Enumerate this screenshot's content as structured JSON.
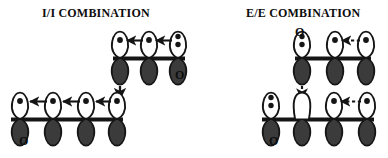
{
  "figure": {
    "background_color": "#ffffff",
    "ink_color": "#151515",
    "lobe_fill_dark": "#3b3b3b",
    "lobe_fill_light": "#ffffff",
    "panels": [
      {
        "id": "ii",
        "title": "I/I COMBINATION",
        "fragments": [
          {
            "id": "ii-top",
            "orbitals": [
              {
                "electrons": 1,
                "top_lobe": "light",
                "bottom_lobe": "dark"
              },
              {
                "electrons": 1,
                "top_lobe": "light",
                "bottom_lobe": "dark"
              },
              {
                "electrons": 2,
                "top_lobe": "light",
                "bottom_lobe": "dark"
              }
            ],
            "arrows": [
              "solid-left",
              "solid-left"
            ],
            "labels": [
              {
                "text": "O",
                "position": "below-right"
              }
            ]
          },
          {
            "id": "ii-bottom",
            "orbitals": [
              {
                "electrons": 1,
                "top_lobe": "light",
                "bottom_lobe": "dark"
              },
              {
                "electrons": 1,
                "top_lobe": "light",
                "bottom_lobe": "dark"
              },
              {
                "electrons": 1,
                "top_lobe": "light",
                "bottom_lobe": "dark"
              },
              {
                "electrons": 1,
                "top_lobe": "light",
                "bottom_lobe": "dark"
              }
            ],
            "arrows": [
              "solid-left",
              "solid-left",
              "solid-left"
            ],
            "labels": [
              {
                "text": "O",
                "position": "below-left"
              }
            ]
          }
        ],
        "linking_arrow": {
          "style": "solid",
          "direction": "down"
        }
      },
      {
        "id": "ee",
        "title": "E/E COMBINATION",
        "fragments": [
          {
            "id": "ee-top",
            "orbitals": [
              {
                "electrons": 2,
                "top_lobe": "light",
                "bottom_lobe": "dark"
              },
              {
                "electrons": 1,
                "top_lobe": "light",
                "bottom_lobe": "dark"
              },
              {
                "electrons": 1,
                "top_lobe": "light",
                "bottom_lobe": "dark"
              }
            ],
            "arrows": [
              "dashed-left"
            ],
            "labels": [
              {
                "text": "O",
                "position": "above-left"
              }
            ]
          },
          {
            "id": "ee-bottom",
            "orbitals": [
              {
                "electrons": 2,
                "top_lobe": "light",
                "bottom_lobe": "dark"
              },
              {
                "electrons": 0,
                "top_lobe": "open",
                "bottom_lobe": "dark"
              },
              {
                "electrons": 1,
                "top_lobe": "light",
                "bottom_lobe": "dark"
              },
              {
                "electrons": 1,
                "top_lobe": "light",
                "bottom_lobe": "dark"
              }
            ],
            "arrows": [
              "dashed-left"
            ],
            "labels": [
              {
                "text": "O",
                "position": "below-left"
              }
            ]
          }
        ],
        "linking_arrow": {
          "style": "dashed",
          "direction": "down"
        }
      }
    ]
  }
}
